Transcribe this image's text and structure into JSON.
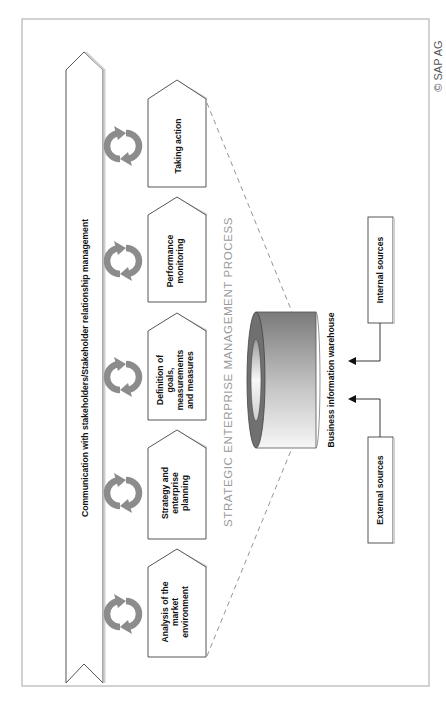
{
  "copyright": "© SAP AG",
  "diagram": {
    "title": "STRATEGIC ENTERPRISE MANAGEMENT PROCESS",
    "banner": "Communication with stakeholders/Stakeholder relationship management",
    "process_steps": [
      {
        "lines": [
          "Analysis of the",
          "market",
          "environment"
        ]
      },
      {
        "lines": [
          "Strategy and",
          "enterprise",
          "planning"
        ]
      },
      {
        "lines": [
          "Definition of",
          "goals,",
          "measurements",
          "and measures"
        ]
      },
      {
        "lines": [
          "Performance",
          "monitoring"
        ]
      },
      {
        "lines": [
          "Taking action"
        ]
      }
    ],
    "warehouse": {
      "label": "Business information warehouse"
    },
    "sources": [
      {
        "label": "External sources"
      },
      {
        "label": "Internal sources"
      }
    ]
  },
  "colors": {
    "frame": "#b5b5b5",
    "cycle_icon": "#8c8c8c",
    "title": "#9a9a9a",
    "dashed_line": "#888888",
    "cylinder_dark": "#6f6f6f",
    "cylinder_light": "#f4f4f4"
  }
}
